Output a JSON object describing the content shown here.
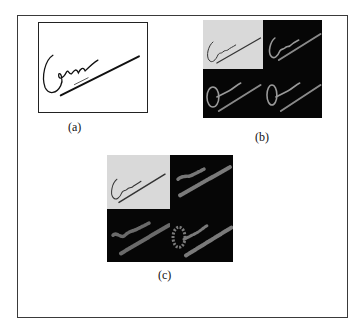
{
  "figure": {
    "panels": [
      {
        "id": "a",
        "label": "(a)",
        "description": "original signature image"
      },
      {
        "id": "b",
        "label": "(b)",
        "description": "2x2 grid: grayscale signature and three edge/filter responses"
      },
      {
        "id": "c",
        "label": "(c)",
        "description": "2x2 grid: grayscale signature and three blurred edge/filter responses"
      }
    ]
  },
  "colors": {
    "ink": "#111111",
    "light_cell": "#d9d9d9",
    "dark_cell": "#060606",
    "edge_stroke": "#9a9a9a",
    "frame": "#3a3a3a"
  }
}
